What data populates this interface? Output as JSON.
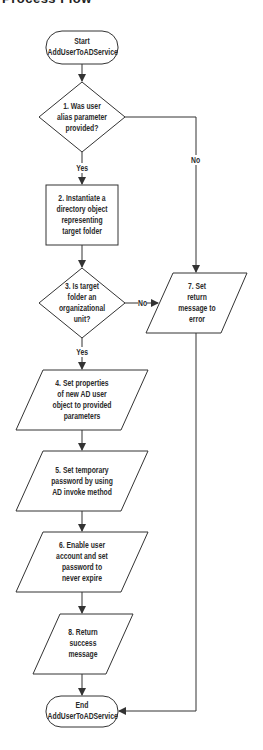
{
  "title": "Process Flow",
  "nodes": [
    {
      "id": "start",
      "type": "terminal",
      "lines": [
        "Start",
        "AddUserToADService"
      ]
    },
    {
      "id": "step1",
      "type": "decision",
      "lines": [
        "1. Was user",
        "alias parameter",
        "provided?"
      ]
    },
    {
      "id": "step2",
      "type": "process",
      "lines": [
        "2. Instantiate a",
        "directory object",
        "representing",
        "target folder"
      ]
    },
    {
      "id": "step3",
      "type": "decision",
      "lines": [
        "3. Is target",
        "folder an",
        "organizational",
        "unit?"
      ]
    },
    {
      "id": "step4",
      "type": "io",
      "lines": [
        "4. Set properties",
        "of new AD user",
        "object to provided",
        "parameters"
      ]
    },
    {
      "id": "step5",
      "type": "io",
      "lines": [
        "5. Set temporary",
        "password by using",
        "AD invoke method"
      ]
    },
    {
      "id": "step6",
      "type": "io",
      "lines": [
        "6. Enable user",
        "account and set",
        "password to",
        "never expire"
      ]
    },
    {
      "id": "step7",
      "type": "io",
      "lines": [
        "7. Set",
        "return",
        "message to",
        "error"
      ]
    },
    {
      "id": "step8",
      "type": "io",
      "lines": [
        "8. Return",
        "success",
        "message"
      ]
    },
    {
      "id": "end",
      "type": "terminal",
      "lines": [
        "End",
        "AddUserToADService"
      ]
    }
  ],
  "edges": [
    {
      "from": "start",
      "to": "step1",
      "label": ""
    },
    {
      "from": "step1",
      "to": "step2",
      "label": "Yes"
    },
    {
      "from": "step1",
      "to": "step7",
      "label": "No"
    },
    {
      "from": "step2",
      "to": "step3",
      "label": ""
    },
    {
      "from": "step3",
      "to": "step4",
      "label": "Yes"
    },
    {
      "from": "step3",
      "to": "step7",
      "label": "No"
    },
    {
      "from": "step4",
      "to": "step5",
      "label": ""
    },
    {
      "from": "step5",
      "to": "step6",
      "label": ""
    },
    {
      "from": "step6",
      "to": "step8",
      "label": ""
    },
    {
      "from": "step8",
      "to": "end",
      "label": ""
    },
    {
      "from": "step7",
      "to": "end",
      "label": ""
    }
  ],
  "labels": {
    "yes1": "Yes",
    "no1": "No",
    "yes3": "Yes",
    "no3": "No"
  },
  "colors": {
    "stroke": "#333333",
    "text": "#2a2a2a",
    "background": "#ffffff"
  }
}
